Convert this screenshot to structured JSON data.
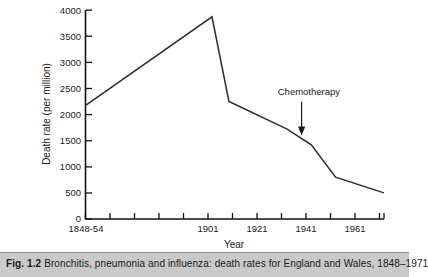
{
  "figure": {
    "caption_number": "Fig. 1.2",
    "caption_text": "Bronchitis, pneumonia and influenza: death rates for England and Wales, 1848–1971"
  },
  "chart_data": {
    "type": "line",
    "title": "",
    "xlabel": "Year",
    "ylabel": "Death rate (per million)",
    "xlim": [
      1848,
      1971
    ],
    "ylim": [
      0,
      4000
    ],
    "grid": false,
    "legend": null,
    "y_ticks": [
      0,
      500,
      1000,
      1500,
      2000,
      2500,
      3000,
      3500,
      4000
    ],
    "y_tick_labels": [
      "0",
      "500",
      "1000",
      "1500",
      "2000",
      "2500",
      "3000",
      "3500",
      "4000"
    ],
    "x_ticks": [
      1848,
      1858,
      1868,
      1878,
      1888,
      1898,
      1901,
      1911,
      1921,
      1931,
      1941,
      1951,
      1961,
      1971
    ],
    "x_tick_labels": [
      "1848-54",
      "",
      "",
      "",
      "",
      "",
      "1901",
      "",
      "1921",
      "",
      "1941",
      "",
      "1961",
      ""
    ],
    "x_labeled_ticks": [
      {
        "value": 1848,
        "label": "1848-54"
      },
      {
        "value": 1901,
        "label": "1901"
      },
      {
        "value": 1921,
        "label": "1921"
      },
      {
        "value": 1941,
        "label": "1941"
      },
      {
        "value": 1961,
        "label": "1961"
      }
    ],
    "series": [
      {
        "name": "Bronchitis, pneumonia and influenza death rate",
        "x": [
          1848,
          1900,
          1907,
          1931,
          1941,
          1951,
          1971
        ],
        "values": [
          2180,
          3870,
          2250,
          1720,
          1420,
          800,
          500
        ]
      }
    ],
    "annotations": [
      {
        "text": "Chemotherapy",
        "x": 1937,
        "y": 1600,
        "arrow": true,
        "arrow_direction": "down",
        "label_x": 1940,
        "label_y": 2380
      }
    ]
  }
}
